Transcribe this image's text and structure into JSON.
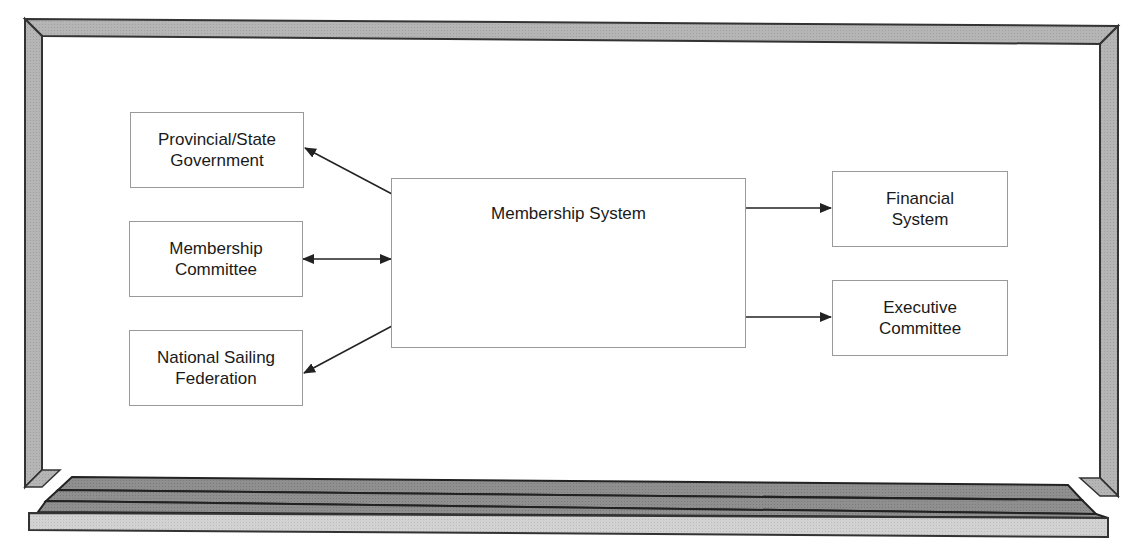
{
  "diagram": {
    "central_system": {
      "label": "Membership System"
    },
    "left_entities": [
      {
        "id": "provincial",
        "label": "Provincial/State\nGovernment",
        "flow": "outgoing"
      },
      {
        "id": "committee",
        "label": "Membership\nCommittee",
        "flow": "bidirectional"
      },
      {
        "id": "federation",
        "label": "National Sailing\nFederation",
        "flow": "outgoing"
      }
    ],
    "right_entities": [
      {
        "id": "financial",
        "label": "Financial\nSystem",
        "flow": "outgoing"
      },
      {
        "id": "executive",
        "label": "Executive\nCommittee",
        "flow": "outgoing"
      }
    ],
    "colors": {
      "frame_fill": "#b8b8b8",
      "frame_stroke": "#333333",
      "tray_dark": "#8e8e8e",
      "tray_light": "#d0d0d0",
      "box_border": "#9a9a9a",
      "arrow": "#222222",
      "text": "#1a1a1a"
    }
  }
}
